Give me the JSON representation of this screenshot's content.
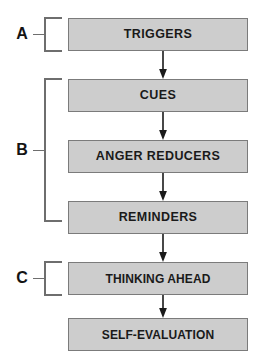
{
  "diagram": {
    "type": "flowchart",
    "orientation": "vertical-top-to-bottom",
    "background_color": "#ffffff",
    "node_fill_color": "#cdcdcd",
    "node_border_color": "#7b7b7b",
    "text_color": "#1a1a1a",
    "bracket_color": "#6e6e6e",
    "arrow_color": "#1a1a1a",
    "nodes": [
      {
        "id": "triggers",
        "label": "TRIGGERS"
      },
      {
        "id": "cues",
        "label": "CUES"
      },
      {
        "id": "anger-reducers",
        "label": "ANGER REDUCERS"
      },
      {
        "id": "reminders",
        "label": "REMINDERS"
      },
      {
        "id": "thinking-ahead",
        "label": "THINKING AHEAD"
      },
      {
        "id": "self-evaluation",
        "label": "SELF-EVALUATION"
      }
    ],
    "connections": [
      {
        "from": "triggers",
        "to": "cues",
        "style": "arrow-down"
      },
      {
        "from": "cues",
        "to": "anger-reducers",
        "style": "arrow-down"
      },
      {
        "from": "anger-reducers",
        "to": "reminders",
        "style": "arrow-down"
      },
      {
        "from": "reminders",
        "to": "thinking-ahead",
        "style": "arrow-down"
      },
      {
        "from": "thinking-ahead",
        "to": "self-evaluation",
        "style": "arrow-down"
      }
    ],
    "groups": [
      {
        "label": "A",
        "covers": [
          "triggers"
        ]
      },
      {
        "label": "B",
        "covers": [
          "cues",
          "anger-reducers",
          "reminders"
        ]
      },
      {
        "label": "C",
        "covers": [
          "thinking-ahead"
        ]
      }
    ]
  }
}
